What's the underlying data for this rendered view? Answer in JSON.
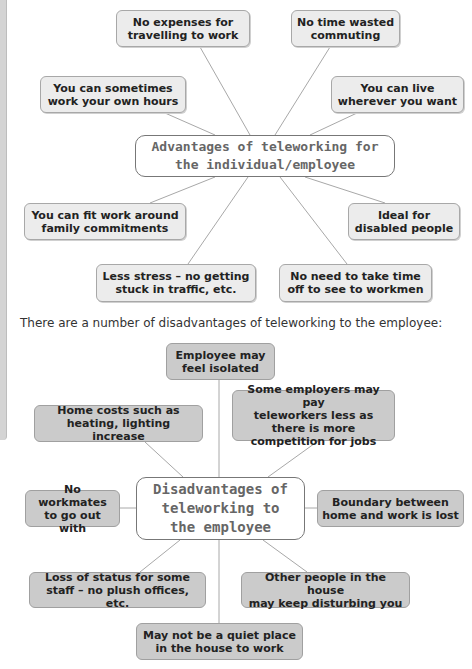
{
  "advantages": {
    "hub": "Advantages of teleworking for\nthe individual/employee",
    "nodes": [
      "No expenses for\ntravelling to work",
      "No time wasted\ncommuting",
      "You can sometimes\nwork your own hours",
      "You can live\nwherever you want",
      "You can fit work around\nfamily commitments",
      "Ideal for\ndisabled people",
      "Less stress – no getting\nstuck in traffic, etc.",
      "No need to take time\noff to see to workmen"
    ]
  },
  "intro_text": "There are a number of disadvantages of teleworking to the employee:",
  "disadvantages": {
    "hub": "Disadvantages of\nteleworking to\nthe employee",
    "nodes": [
      "Employee may\nfeel isolated",
      "Home costs such as\nheating, lighting increase",
      "Some employers may pay\nteleworkers less as\nthere is more competition for jobs",
      "No workmates\nto go out with",
      "Boundary between\nhome and work is lost",
      "Loss of status for some\nstaff – no plush offices, etc.",
      "Other people in the house\nmay keep disturbing you",
      "May not be a quiet place\nin the house to work"
    ]
  },
  "colors": {
    "advantage_box": "#ececec",
    "disadvantage_box": "#cbcbcb",
    "hub_border": "#777777",
    "connector": "#a8a8a8"
  }
}
